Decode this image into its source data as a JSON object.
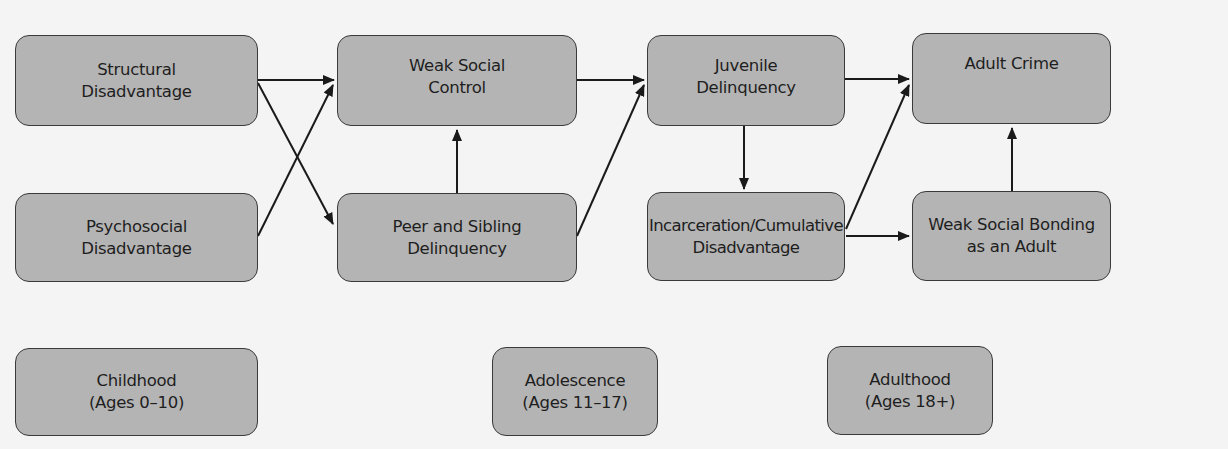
{
  "diagram": {
    "nodes": [
      {
        "id": "structural",
        "lines": [
          "Structural",
          "Disadvantage"
        ]
      },
      {
        "id": "psychosocial",
        "lines": [
          "Psychosocial",
          "Disadvantage"
        ]
      },
      {
        "id": "weak_social_control",
        "lines": [
          "Weak Social",
          "Control"
        ]
      },
      {
        "id": "peer_sibling",
        "lines": [
          "Peer and Sibling",
          "Delinquency"
        ]
      },
      {
        "id": "juvenile",
        "lines": [
          "Juvenile",
          "Delinquency"
        ]
      },
      {
        "id": "incarceration",
        "lines": [
          "Incarceration/Cumulative",
          "Disadvantage"
        ]
      },
      {
        "id": "adult_crime",
        "lines": [
          "Adult Crime"
        ]
      },
      {
        "id": "weak_bonding",
        "lines": [
          "Weak Social Bonding",
          "as an Adult"
        ]
      }
    ],
    "stages": [
      {
        "id": "childhood",
        "lines": [
          "Childhood",
          "(Ages 0–10)"
        ]
      },
      {
        "id": "adolescence",
        "lines": [
          "Adolescence",
          "(Ages 11–17)"
        ]
      },
      {
        "id": "adulthood",
        "lines": [
          "Adulthood",
          "(Ages 18+)"
        ]
      }
    ],
    "edges": [
      {
        "from": "structural",
        "to": "weak_social_control"
      },
      {
        "from": "structural",
        "to": "peer_sibling"
      },
      {
        "from": "psychosocial",
        "to": "weak_social_control"
      },
      {
        "from": "peer_sibling",
        "to": "weak_social_control"
      },
      {
        "from": "weak_social_control",
        "to": "juvenile"
      },
      {
        "from": "peer_sibling",
        "to": "juvenile"
      },
      {
        "from": "juvenile",
        "to": "incarceration"
      },
      {
        "from": "juvenile",
        "to": "adult_crime"
      },
      {
        "from": "incarceration",
        "to": "adult_crime"
      },
      {
        "from": "incarceration",
        "to": "weak_bonding"
      },
      {
        "from": "weak_bonding",
        "to": "adult_crime"
      }
    ],
    "colors": {
      "node_fill": "#b4b4b4",
      "node_border": "#3a3a3a",
      "arrow": "#1a1a1a",
      "background": "#f4f4f4"
    }
  }
}
